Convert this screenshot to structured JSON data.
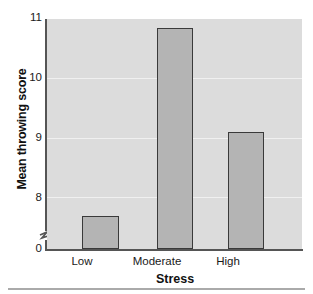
{
  "chart_data": {
    "type": "bar",
    "title": "",
    "categories": [
      "Low",
      "Moderate",
      "High"
    ],
    "values": [
      8.2,
      10.87,
      9.4
    ],
    "xlabel": "Stress",
    "ylabel": "Mean throwing score",
    "ylim": [
      8,
      11
    ],
    "yticks": [
      "0",
      "8",
      "9",
      "10",
      "11"
    ],
    "ytick_values": [
      0,
      8,
      9,
      10,
      11
    ],
    "axis_break": true,
    "grid": true,
    "legend": "none",
    "bar_fill_color": "#b4b4b4",
    "bar_edge_color": "#3a3a3a",
    "plot_background_color": "#dcdcdc",
    "gridline_color": "#f0f0f0",
    "axis_color": "#555555"
  },
  "axis": {
    "y_tick_11": "11",
    "y_tick_10": "10",
    "y_tick_9": "9",
    "y_tick_8": "8",
    "y_tick_0": "0",
    "x_tick_low": "Low",
    "x_tick_moderate": "Moderate",
    "x_tick_high": "High",
    "x_title": "Stress",
    "y_title": "Mean throwing score"
  }
}
